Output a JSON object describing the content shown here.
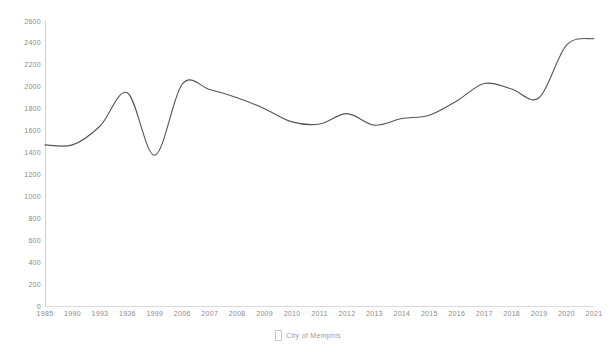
{
  "chart_data": {
    "type": "line",
    "title": "",
    "subtitle": "",
    "xlabel": "",
    "ylabel": "",
    "grid": false,
    "legend_position": "bottom",
    "ylim": [
      0,
      2600
    ],
    "y_ticks": [
      0,
      200,
      400,
      600,
      800,
      1000,
      1200,
      1400,
      1600,
      1800,
      2000,
      2200,
      2400,
      2600
    ],
    "x_tick_labels": [
      "1985",
      "1990",
      "1993",
      "1936",
      "1999",
      "2006",
      "2007",
      "2008",
      "2009",
      "2010",
      "2011",
      "2012",
      "2013",
      "2014",
      "2015",
      "2016",
      "2017",
      "2018",
      "2019",
      "2020",
      "2021"
    ],
    "series": [
      {
        "name": "City of Memphis",
        "color": "#555555",
        "x": [
          "1985",
          "1990",
          "1993",
          "1936",
          "1999",
          "2006",
          "2007",
          "2008",
          "2009",
          "2010",
          "2011",
          "2012",
          "2013",
          "2014",
          "2015",
          "2016",
          "2017",
          "2018",
          "2019",
          "2020",
          "2021"
        ],
        "values": [
          1470,
          1470,
          1640,
          1945,
          1375,
          2025,
          1975,
          1900,
          1800,
          1680,
          1660,
          1755,
          1650,
          1710,
          1740,
          1870,
          2030,
          1980,
          1900,
          2380,
          2440
        ]
      }
    ]
  },
  "legend": {
    "marker": "square-outline-marker",
    "label": "City of Memphis"
  }
}
